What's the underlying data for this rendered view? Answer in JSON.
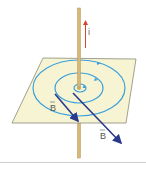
{
  "figure": {
    "current_label": "i",
    "field_label_1": "B",
    "field_label_2": "B",
    "colors": {
      "wire": "#d8b878",
      "wire_edge": "#b8965a",
      "plane_fill": "#f6f4d2",
      "plane_edge": "#8a8a7a",
      "field_lines": "#3aa0dc",
      "vectors": "#2a3a8c",
      "current_arrow": "#d9432e"
    }
  }
}
